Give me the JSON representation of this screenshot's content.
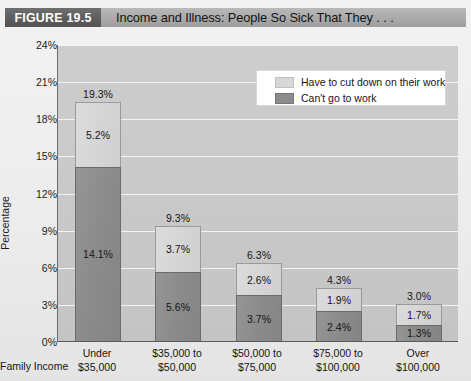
{
  "header": {
    "figure_tag": "FIGURE 19.5",
    "title": "Income and Illness: People So Sick That They . . ."
  },
  "axes": {
    "y_label": "Percentage",
    "x_label": "Family Income",
    "y_ticks": [
      "24%",
      "21%",
      "18%",
      "15%",
      "12%",
      "9%",
      "6%",
      "3%",
      "0%"
    ]
  },
  "legend": {
    "items": [
      {
        "label": "Have to cut down on their work",
        "color": "#d8d8d8"
      },
      {
        "label": "Can't go to work",
        "color": "#8c8c8c"
      }
    ]
  },
  "chart_data": {
    "type": "bar",
    "stacked": true,
    "title": "Income and Illness: People So Sick That They . . .",
    "xlabel": "Family Income",
    "ylabel": "Percentage",
    "ylim": [
      0,
      24
    ],
    "ytick_step": 3,
    "grid": true,
    "legend_position": "top-right",
    "categories": [
      "Under $35,000",
      "$35,000 to $50,000",
      "$50,000 to $75,000",
      "$75,000 to $100,000",
      "Over $100,000"
    ],
    "category_lines": [
      [
        "Under",
        "$35,000"
      ],
      [
        "$35,000 to",
        "$50,000"
      ],
      [
        "$50,000 to",
        "$75,000"
      ],
      [
        "$75,000 to",
        "$100,000"
      ],
      [
        "Over",
        "$100,000"
      ]
    ],
    "series": [
      {
        "name": "Can't go to work",
        "color": "#8c8c8c",
        "values": [
          14.1,
          5.6,
          3.7,
          2.4,
          1.3
        ]
      },
      {
        "name": "Have to cut down on their work",
        "color": "#d8d8d8",
        "values": [
          5.2,
          3.7,
          2.6,
          1.9,
          1.7
        ]
      }
    ],
    "totals": [
      19.3,
      9.3,
      6.3,
      4.3,
      3.0
    ],
    "value_labels": {
      "dark": [
        "14.1%",
        "5.6%",
        "3.7%",
        "2.4%",
        "1.3%"
      ],
      "light": [
        "5.2%",
        "3.7%",
        "2.6%",
        "1.9%",
        "1.7%"
      ],
      "total": [
        "19.3%",
        "9.3%",
        "6.3%",
        "4.3%",
        "3.0%"
      ]
    }
  }
}
